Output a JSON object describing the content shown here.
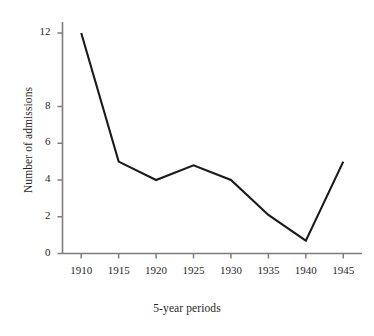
{
  "chart_data": {
    "type": "line",
    "title": "",
    "xlabel": "5-year periods",
    "ylabel": "Number of admissions",
    "categories": [
      "1910",
      "1915",
      "1920",
      "1925",
      "1930",
      "1935",
      "1940",
      "1945"
    ],
    "x": [
      1910,
      1915,
      1920,
      1925,
      1930,
      1935,
      1940,
      1945
    ],
    "values": [
      12,
      5,
      4,
      4.8,
      4,
      2.1,
      0.7,
      5
    ],
    "series": [
      {
        "name": "Number of admissions",
        "values": [
          12,
          5,
          4,
          4.8,
          4,
          2.1,
          0.7,
          5
        ]
      }
    ],
    "xlim": [
      1907.5,
      1947.5
    ],
    "ylim": [
      0,
      12.6
    ],
    "y_ticks": [
      0,
      2,
      4,
      6,
      8,
      12
    ],
    "y_tick_labels": [
      "0",
      "2",
      "4",
      "6",
      "8",
      "12"
    ],
    "x_ticks": [
      1910,
      1915,
      1920,
      1925,
      1930,
      1935,
      1940,
      1945
    ],
    "grid": false,
    "legend": "none",
    "line_color": "#1a1a1a",
    "axis_color": "#7a7a7a",
    "background_color": "#ffffff",
    "markers": false
  },
  "axes": {
    "y_title": "Number of admissions",
    "x_title": "5-year periods"
  }
}
